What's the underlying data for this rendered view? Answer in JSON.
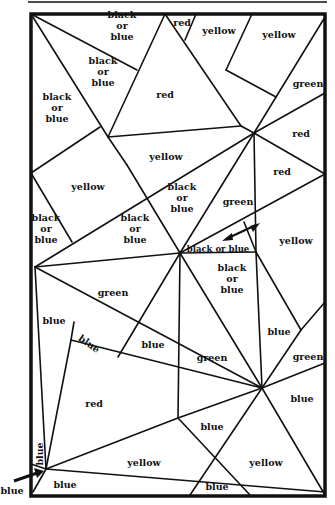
{
  "diagram": {
    "type": "map-coloring-puzzle",
    "frame": {
      "left": 30,
      "top": 13,
      "right": 327,
      "bottom": 497
    },
    "regions": [
      {
        "id": "r1",
        "label": [
          "black",
          "or",
          "blue"
        ],
        "x": 122,
        "y": 26
      },
      {
        "id": "r2",
        "label": [
          "red"
        ],
        "x": 182,
        "y": 23
      },
      {
        "id": "r3",
        "label": [
          "yellow"
        ],
        "x": 219,
        "y": 31
      },
      {
        "id": "r4",
        "label": [
          "yellow"
        ],
        "x": 279,
        "y": 35
      },
      {
        "id": "r5",
        "label": [
          "black",
          "or",
          "blue"
        ],
        "x": 103,
        "y": 72
      },
      {
        "id": "r6",
        "label": [
          "red"
        ],
        "x": 165,
        "y": 95
      },
      {
        "id": "r7",
        "label": [
          "green"
        ],
        "x": 308,
        "y": 84
      },
      {
        "id": "r8",
        "label": [
          "black",
          "or",
          "blue"
        ],
        "x": 57,
        "y": 108
      },
      {
        "id": "r9",
        "label": [
          "red"
        ],
        "x": 301,
        "y": 134
      },
      {
        "id": "r10",
        "label": [
          "yellow"
        ],
        "x": 166,
        "y": 157
      },
      {
        "id": "r11",
        "label": [
          "yellow"
        ],
        "x": 88,
        "y": 187
      },
      {
        "id": "r12",
        "label": [
          "red"
        ],
        "x": 282,
        "y": 172
      },
      {
        "id": "r13",
        "label": [
          "black",
          "or",
          "blue"
        ],
        "x": 182,
        "y": 198
      },
      {
        "id": "r14",
        "label": [
          "green"
        ],
        "x": 238,
        "y": 202
      },
      {
        "id": "r15",
        "label": [
          "black",
          "or",
          "blue"
        ],
        "x": 46,
        "y": 229
      },
      {
        "id": "r16",
        "label": [
          "black",
          "or",
          "blue"
        ],
        "x": 135,
        "y": 229
      },
      {
        "id": "r17",
        "label": [
          "yellow"
        ],
        "x": 296,
        "y": 241
      },
      {
        "id": "r18",
        "label": [
          "black or blue"
        ],
        "x": 218,
        "y": 249,
        "small": true
      },
      {
        "id": "r19",
        "label": [
          "green"
        ],
        "x": 113,
        "y": 293
      },
      {
        "id": "r20",
        "label": [
          "black",
          "or",
          "blue"
        ],
        "x": 232,
        "y": 279
      },
      {
        "id": "r21",
        "label": [
          "blue"
        ],
        "x": 54,
        "y": 321
      },
      {
        "id": "r22",
        "label": [
          "blue"
        ],
        "x": 89,
        "y": 344,
        "rotate": 35
      },
      {
        "id": "r23",
        "label": [
          "blue"
        ],
        "x": 153,
        "y": 345
      },
      {
        "id": "r24",
        "label": [
          "blue"
        ],
        "x": 279,
        "y": 332
      },
      {
        "id": "r25",
        "label": [
          "green"
        ],
        "x": 212,
        "y": 358
      },
      {
        "id": "r26",
        "label": [
          "green"
        ],
        "x": 308,
        "y": 357
      },
      {
        "id": "r27",
        "label": [
          "red"
        ],
        "x": 94,
        "y": 404
      },
      {
        "id": "r28",
        "label": [
          "blue"
        ],
        "x": 302,
        "y": 399
      },
      {
        "id": "r29",
        "label": [
          "blue"
        ],
        "x": 212,
        "y": 427
      },
      {
        "id": "r30",
        "label": [
          "blue"
        ],
        "x": 40,
        "y": 454,
        "rotate": -90
      },
      {
        "id": "r31",
        "label": [
          "yellow"
        ],
        "x": 144,
        "y": 463
      },
      {
        "id": "r32",
        "label": [
          "yellow"
        ],
        "x": 266,
        "y": 463
      },
      {
        "id": "r33",
        "label": [
          "blue"
        ],
        "x": 65,
        "y": 485
      },
      {
        "id": "r34",
        "label": [
          "blue"
        ],
        "x": 217,
        "y": 487
      }
    ],
    "callouts": [
      {
        "id": "c1",
        "label": "blue",
        "x": 12,
        "y": 494
      }
    ]
  }
}
